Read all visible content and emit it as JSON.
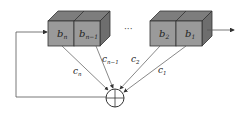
{
  "diagram": {
    "type": "linear-feedback-shift-register",
    "registers": [
      {
        "label": "b",
        "sub": "n"
      },
      {
        "label": "b",
        "sub": "n−1"
      },
      {
        "label": "b",
        "sub": "2"
      },
      {
        "label": "b",
        "sub": "1"
      }
    ],
    "ellipsis": "···",
    "coefficients": [
      {
        "label": "c",
        "sub": "n"
      },
      {
        "label": "c",
        "sub": "n−1"
      },
      {
        "label": "c",
        "sub": "2"
      },
      {
        "label": "c",
        "sub": "1"
      }
    ],
    "adder_symbol": "xor-circle-plus",
    "colors": {
      "box_front": "#9a9a9a",
      "box_top": "#7d7d7d",
      "box_side": "#6e6e6e",
      "stroke": "#333333",
      "line": "#555555"
    }
  }
}
